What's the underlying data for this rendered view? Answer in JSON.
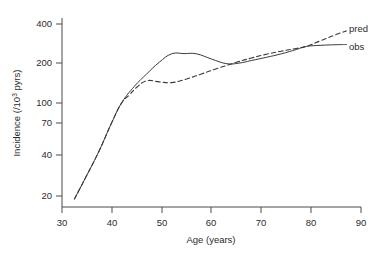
{
  "chart_data": {
    "type": "line",
    "title": "",
    "xlabel": "Age (years)",
    "ylabel": "Incidence (/10",
    "ylabel_sup": "3",
    "ylabel_tail": " pyrs)",
    "xlim": [
      30,
      90
    ],
    "ylim": [
      17,
      450
    ],
    "yscale": "log",
    "grid": false,
    "legend_position": "right-inside",
    "xticks": [
      30,
      40,
      50,
      60,
      70,
      80,
      90
    ],
    "xticklabels": [
      "30",
      "40",
      "50",
      "60",
      "70",
      "80",
      "90"
    ],
    "yticks": [
      20,
      40,
      70,
      100,
      200,
      400
    ],
    "yticklabels": [
      "20",
      "40",
      "70",
      "100",
      "200",
      "400"
    ],
    "series": [
      {
        "name": "obs",
        "style": "solid",
        "color": "#3a3a3a",
        "x": [
          32.5,
          35,
          37.5,
          40,
          42,
          44.5,
          47,
          49.5,
          52,
          54.5,
          57,
          60,
          63,
          65.5,
          68,
          71,
          74,
          77,
          79,
          82,
          85,
          87
        ],
        "y": [
          19,
          29,
          45,
          74,
          105,
          140,
          175,
          215,
          250,
          251,
          250,
          228,
          210,
          212,
          222,
          235,
          250,
          270,
          285,
          291,
          294,
          295
        ]
      },
      {
        "name": "pred",
        "style": "dashed",
        "color": "#3a3a3a",
        "x": [
          32.5,
          35,
          37.5,
          40,
          42,
          43.5,
          45,
          47,
          49.5,
          52,
          55,
          58,
          61,
          65,
          68,
          71,
          74,
          77,
          79,
          82,
          85,
          87
        ],
        "y": [
          19,
          29,
          45,
          74,
          105,
          120,
          138,
          155,
          152,
          150,
          160,
          175,
          192,
          215,
          232,
          248,
          262,
          275,
          285,
          317,
          352,
          375
        ]
      }
    ],
    "legend": [
      {
        "label": "pred",
        "style": "dashed"
      },
      {
        "label": "obs",
        "style": "solid"
      }
    ]
  }
}
